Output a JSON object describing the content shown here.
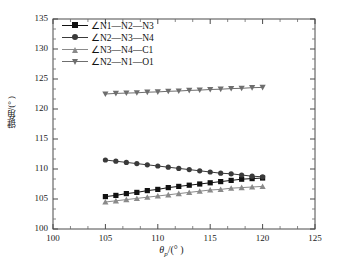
{
  "chart_data": {
    "type": "line",
    "title": "",
    "xlabel": "θp/(°)",
    "ylabel": "键角/(°)",
    "xlim": [
      100,
      125
    ],
    "ylim": [
      100,
      135
    ],
    "xticks": [
      100,
      105,
      110,
      115,
      120,
      125
    ],
    "yticks": [
      100,
      105,
      110,
      115,
      120,
      125,
      130,
      135
    ],
    "x_minor_per_interval": 2,
    "y_minor_per_interval": 2,
    "grid": false,
    "legend_position": "upper left",
    "x": [
      105,
      106,
      107,
      108,
      109,
      110,
      111,
      112,
      113,
      114,
      115,
      116,
      117,
      118,
      119,
      120
    ],
    "series": [
      {
        "name": "∠N1—N2—N3",
        "marker": "square",
        "color": "#111111",
        "values": [
          105.4,
          105.6,
          105.9,
          106.1,
          106.4,
          106.6,
          106.9,
          107.1,
          107.3,
          107.5,
          107.7,
          107.9,
          108.1,
          108.3,
          108.4,
          108.5
        ]
      },
      {
        "name": "∠N2—N3—N4",
        "marker": "circle",
        "color": "#3a3a3a",
        "values": [
          111.5,
          111.3,
          111.1,
          110.9,
          110.7,
          110.5,
          110.3,
          110.1,
          109.9,
          109.7,
          109.5,
          109.3,
          109.2,
          109.0,
          108.8,
          108.7
        ]
      },
      {
        "name": "∠N3—N4—C1",
        "marker": "triangle-up",
        "color": "#8a8a8a",
        "values": [
          104.5,
          104.7,
          104.9,
          105.1,
          105.3,
          105.5,
          105.7,
          105.9,
          106.1,
          106.3,
          106.5,
          106.6,
          106.8,
          106.9,
          107.0,
          107.1
        ]
      },
      {
        "name": "∠N2—N1—O1",
        "marker": "triangle-down",
        "color": "#6e6e6e",
        "values": [
          122.5,
          122.6,
          122.65,
          122.7,
          122.8,
          122.85,
          122.95,
          123.0,
          123.1,
          123.15,
          123.25,
          123.3,
          123.4,
          123.45,
          123.55,
          123.6
        ]
      }
    ]
  },
  "axis": {
    "x_title_symbol": "θ",
    "x_title_sub": "p",
    "x_title_rest": "/(° )",
    "y_title": "键角/(° )"
  }
}
